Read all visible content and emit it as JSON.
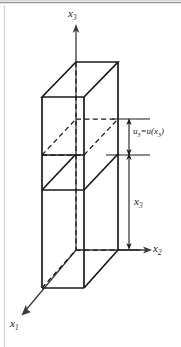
{
  "figure": {
    "background_color": "#ffffff",
    "line_color": "#1a1a1a",
    "frame_color": "#cfcfcf",
    "axes": {
      "x3": {
        "label": "x",
        "sub": "3",
        "direction": "up"
      },
      "x2": {
        "label": "x",
        "sub": "2",
        "direction": "right"
      },
      "x1": {
        "label": "x",
        "sub": "1",
        "direction": "down-left"
      }
    },
    "annotations": {
      "displacement": {
        "lead": "u",
        "lead_sub": "3",
        "equals": "=",
        "func": "u(",
        "arg": "x",
        "arg_sub": "3",
        "close": ")",
        "full_text": "u3= u(x3)"
      },
      "height": {
        "label": "x",
        "sub": "3",
        "full_text": "x3"
      }
    },
    "elements": [
      "prism-outline",
      "top-face",
      "dashed-cross-section",
      "solid-cross-section",
      "bottom-face",
      "hidden-back-edges",
      "dimension-u3",
      "dimension-x3"
    ]
  }
}
